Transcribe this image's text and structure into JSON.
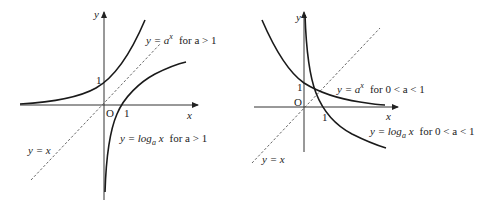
{
  "left_panel": {
    "axis_x": "x",
    "axis_y": "y",
    "origin": "O",
    "tick_y_one": "1",
    "tick_x_one": "1",
    "exp_label": {
      "lhs": "y = a",
      "exp": "x",
      "cond": "for  a > 1"
    },
    "log_label": {
      "lhs": "y = log",
      "sub": "a",
      "arg": " x",
      "cond": "for  a > 1"
    },
    "identity_label": "y = x"
  },
  "right_panel": {
    "axis_x": "x",
    "axis_y": "y",
    "origin": "O",
    "tick_y_one": "1",
    "tick_x_one": "1",
    "exp_label": {
      "lhs": "y = a",
      "exp": "x",
      "cond": "for  0 < a < 1"
    },
    "log_label": {
      "lhs": "y = log",
      "sub": "a",
      "arg": " x",
      "cond": "for  0 < a < 1"
    },
    "identity_label": "y = x"
  },
  "colors": {
    "curve": "#1a1a1a",
    "axis": "#333333",
    "dashed": "#555555"
  }
}
